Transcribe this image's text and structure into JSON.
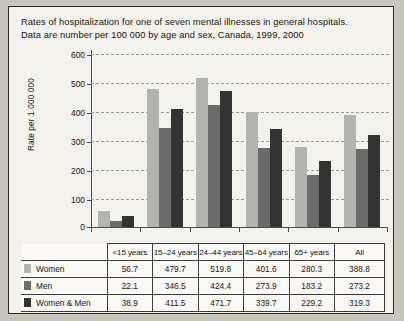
{
  "caption": {
    "line1": "Rates of hospitalization for one of seven mental illnesses in general hospitals.",
    "line2": "Data are number per 100 000 by age and sex, Canada, 1999, 2000"
  },
  "colors": {
    "women": "#b3b3b1",
    "men": "#6b6b6b",
    "both": "#333333",
    "axis": "#4a4a4a",
    "grid": "#9a9a94",
    "panel": "#f4f2ec",
    "page": "#c9c6bd"
  },
  "chart_data": {
    "type": "bar",
    "title": "Rates of hospitalization for one of seven mental illnesses in general hospitals. Data are number per 100 000 by age and sex, Canada, 1999, 2000",
    "xlabel": "",
    "ylabel": "Rate per 1 000 000",
    "ylim": [
      0,
      600
    ],
    "yticks": [
      0,
      100,
      200,
      300,
      400,
      500,
      600
    ],
    "ytick_labels": [
      "0",
      "100",
      "200",
      "300",
      "400",
      "500",
      "600"
    ],
    "grid": true,
    "legend_position": "table-row-labels",
    "categories": [
      "<15 years",
      "15–24 years",
      "24–44 years",
      "45–64 years",
      "65+ years",
      "All"
    ],
    "series": [
      {
        "name": "Women",
        "values": [
          56.7,
          479.7,
          519.8,
          401.6,
          280.3,
          388.8
        ]
      },
      {
        "name": "Men",
        "values": [
          22.1,
          346.5,
          424.4,
          273.9,
          183.2,
          273.2
        ]
      },
      {
        "name": "Women & Men",
        "values": [
          38.9,
          411.5,
          471.7,
          339.7,
          229.2,
          319.3
        ]
      }
    ]
  },
  "table": {
    "corner": "",
    "columns": [
      "<15 years",
      "15–24 years",
      "24–44 years",
      "45–64 years",
      "65+ years",
      "All"
    ],
    "rows": [
      {
        "label": "Women",
        "values": [
          "56.7",
          "479.7",
          "519.8",
          "401.6",
          "280.3",
          "388.8"
        ]
      },
      {
        "label": "Men",
        "values": [
          "22.1",
          "346.5",
          "424.4",
          "273.9",
          "183.2",
          "273.2"
        ]
      },
      {
        "label": "Women & Men",
        "values": [
          "38.9",
          "411.5",
          "471.7",
          "339.7",
          "229.2",
          "319.3"
        ]
      }
    ]
  }
}
